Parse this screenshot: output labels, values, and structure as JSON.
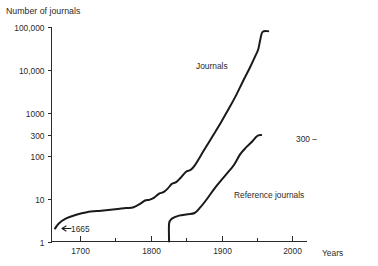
{
  "chart_data": {
    "type": "line",
    "title": "Number of journals",
    "xlabel": "Years",
    "ylabel": "Number of journals",
    "yscale": "log",
    "ylim": [
      1,
      100000
    ],
    "xlim": [
      1660,
      2020
    ],
    "grid": false,
    "legend": "inline-labels",
    "y_ticks": [
      {
        "value": 100000,
        "label": "100,000"
      },
      {
        "value": 10000,
        "label": "10,000"
      },
      {
        "value": 1000,
        "label": "1000"
      },
      {
        "value": 300,
        "label": "300"
      },
      {
        "value": 100,
        "label": "100"
      },
      {
        "value": 10,
        "label": "10"
      },
      {
        "value": 1,
        "label": "1"
      }
    ],
    "x_ticks": [
      {
        "value": 1700,
        "label": "1700"
      },
      {
        "value": 1750,
        "label": ""
      },
      {
        "value": 1800,
        "label": "1800"
      },
      {
        "value": 1850,
        "label": ""
      },
      {
        "value": 1900,
        "label": "1900"
      },
      {
        "value": 1950,
        "label": ""
      },
      {
        "value": 2000,
        "label": "2000"
      }
    ],
    "annotations": [
      {
        "name": "origin-year",
        "text": "1665",
        "x": 1665,
        "y": 2
      },
      {
        "name": "reference-endpoint",
        "text": "300 –",
        "x": 1975,
        "y": 300
      }
    ],
    "series": [
      {
        "name": "Journals",
        "label": "Journals",
        "label_x": 1840,
        "label_y": 8000,
        "points": [
          {
            "x": 1665,
            "y": 2
          },
          {
            "x": 1670,
            "y": 2.6
          },
          {
            "x": 1680,
            "y": 3.4
          },
          {
            "x": 1695,
            "y": 4.2
          },
          {
            "x": 1710,
            "y": 4.8
          },
          {
            "x": 1730,
            "y": 5.2
          },
          {
            "x": 1750,
            "y": 5.6
          },
          {
            "x": 1765,
            "y": 6.0
          },
          {
            "x": 1775,
            "y": 6.2
          },
          {
            "x": 1785,
            "y": 7.5
          },
          {
            "x": 1792,
            "y": 9.0
          },
          {
            "x": 1798,
            "y": 9.3
          },
          {
            "x": 1805,
            "y": 10.5
          },
          {
            "x": 1812,
            "y": 13
          },
          {
            "x": 1818,
            "y": 14
          },
          {
            "x": 1824,
            "y": 17
          },
          {
            "x": 1830,
            "y": 22
          },
          {
            "x": 1836,
            "y": 24
          },
          {
            "x": 1842,
            "y": 30
          },
          {
            "x": 1850,
            "y": 42
          },
          {
            "x": 1856,
            "y": 46
          },
          {
            "x": 1862,
            "y": 58
          },
          {
            "x": 1875,
            "y": 130
          },
          {
            "x": 1890,
            "y": 330
          },
          {
            "x": 1900,
            "y": 620
          },
          {
            "x": 1910,
            "y": 1200
          },
          {
            "x": 1920,
            "y": 2400
          },
          {
            "x": 1930,
            "y": 5200
          },
          {
            "x": 1940,
            "y": 11000
          },
          {
            "x": 1948,
            "y": 21000
          },
          {
            "x": 1952,
            "y": 30000
          },
          {
            "x": 1955,
            "y": 52000
          },
          {
            "x": 1958,
            "y": 75000
          },
          {
            "x": 1966,
            "y": 78000
          }
        ]
      },
      {
        "name": "Reference journals",
        "label": "Reference journals",
        "label_x": 1895,
        "label_y": 26,
        "points": [
          {
            "x": 1826,
            "y": 1.0
          },
          {
            "x": 1826,
            "y": 2.6
          },
          {
            "x": 1830,
            "y": 3.4
          },
          {
            "x": 1840,
            "y": 4.0
          },
          {
            "x": 1852,
            "y": 4.3
          },
          {
            "x": 1862,
            "y": 4.6
          },
          {
            "x": 1870,
            "y": 6.2
          },
          {
            "x": 1880,
            "y": 10
          },
          {
            "x": 1890,
            "y": 17
          },
          {
            "x": 1900,
            "y": 27
          },
          {
            "x": 1910,
            "y": 42
          },
          {
            "x": 1918,
            "y": 62
          },
          {
            "x": 1926,
            "y": 105
          },
          {
            "x": 1934,
            "y": 150
          },
          {
            "x": 1942,
            "y": 200
          },
          {
            "x": 1950,
            "y": 280
          },
          {
            "x": 1956,
            "y": 300
          }
        ]
      }
    ]
  }
}
